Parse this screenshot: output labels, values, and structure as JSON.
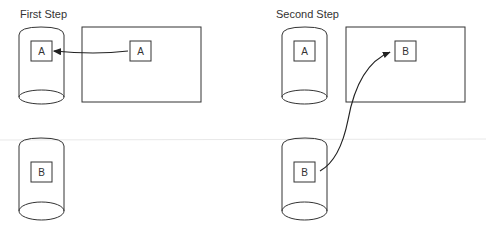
{
  "steps": [
    {
      "title": "First Step",
      "disk_top_item": "A",
      "disk_bottom_item": "B",
      "memory_item": "A",
      "arrow": "memory to disk"
    },
    {
      "title": "Second Step",
      "disk_top_item": "A",
      "disk_bottom_item": "B",
      "memory_item": "B",
      "arrow": "disk to memory"
    }
  ],
  "colors": {
    "stroke": "#333333",
    "separator": "#e8e8e8"
  }
}
